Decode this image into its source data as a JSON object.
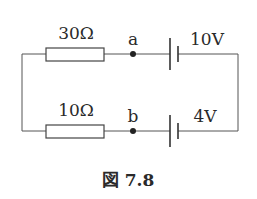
{
  "figure": {
    "caption": "図 7.8",
    "top_branch": {
      "resistor_label": "30Ω",
      "node_label": "a",
      "battery_label": "10V"
    },
    "bottom_branch": {
      "resistor_label": "10Ω",
      "node_label": "b",
      "battery_label": "4V"
    }
  },
  "colors": {
    "background": "#ffffff",
    "line": "#555555",
    "text": "#2a2a2a"
  }
}
